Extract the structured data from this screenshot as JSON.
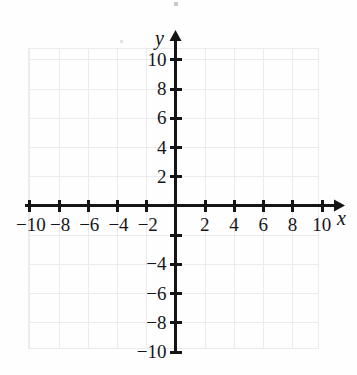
{
  "figure": {
    "kind": "cartesian-coordinate-plane",
    "title": "",
    "background_color": "#fefefe",
    "axis_color": "#151518",
    "grid_color": "#ebebef",
    "label_color": "#16161a"
  },
  "axes": {
    "x": {
      "name": "x",
      "min": -11.6,
      "max": 11.6,
      "arrow_end": "positive",
      "tick_step": 2,
      "labeled_ticks": [
        -10,
        -8,
        -6,
        -4,
        -2,
        2,
        4,
        6,
        8,
        10
      ],
      "tick_labels": [
        "−10",
        "−8",
        "−6",
        "−4",
        "−2",
        "2",
        "4",
        "6",
        "8",
        "10"
      ]
    },
    "y": {
      "name": "y",
      "min": -11.3,
      "max": 11.6,
      "arrow_end": "positive",
      "tick_step": 2,
      "labeled_ticks": [
        10,
        8,
        6,
        4,
        2,
        -4,
        -6,
        -8,
        -10
      ],
      "tick_labels": [
        "10",
        "8",
        "6",
        "4",
        "2",
        "−4",
        "−6",
        "−8",
        "−10"
      ],
      "unlabeled_ticks": [
        -2
      ]
    }
  },
  "chart_data": {
    "type": "scatter",
    "title": "",
    "xlabel": "x",
    "ylabel": "y",
    "xlim": [
      -11.6,
      11.6
    ],
    "ylim": [
      -11.3,
      11.6
    ],
    "grid": true,
    "grid_step": 2,
    "legend": "none",
    "series": [],
    "points": [],
    "annotations": [],
    "note": "Blank coordinate grid with no plotted data"
  },
  "grid": {
    "x_lines": [
      -10,
      -8,
      -6,
      -4,
      -2,
      0,
      2,
      4,
      6,
      8,
      10
    ],
    "y_lines": [
      -10,
      -8,
      -6,
      -4,
      -2,
      0,
      2,
      4,
      6,
      8,
      10
    ]
  },
  "x_tick_labels": [
    {
      "value": -10,
      "text": "−10"
    },
    {
      "value": -8,
      "text": "−8"
    },
    {
      "value": -6,
      "text": "−6"
    },
    {
      "value": -4,
      "text": "−4"
    },
    {
      "value": -2,
      "text": "−2"
    },
    {
      "value": 2,
      "text": "2"
    },
    {
      "value": 4,
      "text": "4"
    },
    {
      "value": 6,
      "text": "6"
    },
    {
      "value": 8,
      "text": "8"
    },
    {
      "value": 10,
      "text": "10"
    }
  ],
  "y_tick_labels": [
    {
      "value": 10,
      "text": "10"
    },
    {
      "value": 8,
      "text": "8"
    },
    {
      "value": 6,
      "text": "6"
    },
    {
      "value": 4,
      "text": "4"
    },
    {
      "value": 2,
      "text": "2"
    },
    {
      "value": -4,
      "text": "−4"
    },
    {
      "value": -6,
      "text": "−6"
    },
    {
      "value": -8,
      "text": "−8"
    },
    {
      "value": -10,
      "text": "−10"
    }
  ]
}
